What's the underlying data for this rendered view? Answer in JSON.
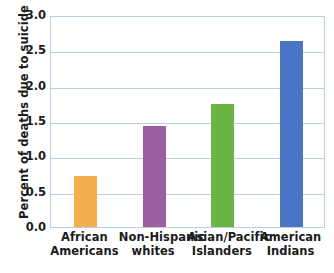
{
  "chart_data": {
    "type": "bar",
    "title": "",
    "xlabel": "",
    "ylabel": "Percent of deaths due to suicide",
    "categories": [
      "African Americans",
      "Non-Hispanic whites",
      "Asian/Pacific Islanders",
      "American Indians"
    ],
    "category_lines": [
      [
        "African",
        "Americans"
      ],
      [
        "Non-Hispanic",
        "whites"
      ],
      [
        "Asian/Pacific",
        "Islanders"
      ],
      [
        "American",
        "Indians"
      ]
    ],
    "values": [
      0.72,
      1.43,
      1.74,
      2.63
    ],
    "bar_colors": [
      "#F5AE4E",
      "#9B5FA0",
      "#6BB544",
      "#4A74C4"
    ],
    "ylim": [
      0.0,
      3.0
    ],
    "ytick_labels": [
      "3.0",
      "2.5",
      "2.0",
      "1.5",
      "1.0",
      "0.5",
      "0.0"
    ],
    "ytick_values": [
      3.0,
      2.5,
      2.0,
      1.5,
      1.0,
      0.5,
      0.0
    ],
    "grid": true,
    "grid_color": "#b9cde4",
    "legend": "none",
    "text_color": "#1b1b1b"
  }
}
